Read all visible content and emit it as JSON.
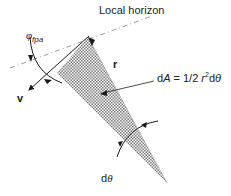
{
  "diagram": {
    "labels": {
      "local_horizon": "Local horizon",
      "phi_symbol": "φ",
      "phi_subscript": "fpa",
      "radius": "r",
      "velocity": "v",
      "area_prefix": "d",
      "area_var": "A",
      "area_eq": " = 1/2 ",
      "area_r": "r",
      "area_exp": "2",
      "area_d": "d",
      "area_theta": "θ",
      "dtheta_d": "d",
      "dtheta_theta": "θ"
    },
    "colors": {
      "line": "#1a1a1a",
      "hatch": "#8a8a8a",
      "dash": "#9a9a9a"
    }
  }
}
